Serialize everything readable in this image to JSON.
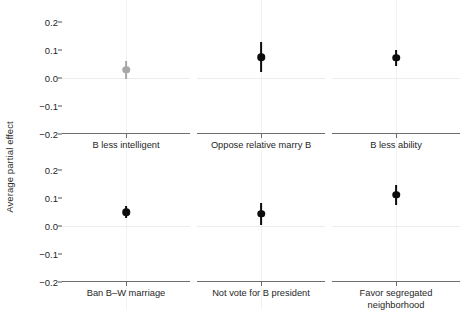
{
  "chart_data": {
    "type": "scatter",
    "title": "",
    "subtitle": "",
    "xlabel": "",
    "ylabel": "Average partial effect",
    "ylim": [
      -0.225,
      0.225
    ],
    "yticks": [
      0.2,
      0.1,
      0.0,
      -0.1,
      -0.2
    ],
    "ytick_labels": [
      "0.2",
      "0.1",
      "0.0",
      "−0.1",
      "−0.2"
    ],
    "grid": "zero-reference line at 0.0 plus faint vertical center gridline per panel",
    "legend": "none",
    "layout": "2 rows × 3 columns of small-multiple panels",
    "marker": "point estimate dot with vertical confidence-interval bar",
    "colors": {
      "significant": "#0d0d0d",
      "nonsignificant": "#a8a8a8",
      "axis": "#6e6e6e",
      "zero_line": "#ececed",
      "grid": "#f2f2f3",
      "text": "#1f1f1f",
      "background": "#ffffff"
    },
    "panels": [
      {
        "label": "B less intelligent",
        "row": 0,
        "col": 0,
        "estimate": 0.029,
        "ci_low": -0.003,
        "ci_high": 0.061,
        "significant": false,
        "color": "#a8a8a8"
      },
      {
        "label": "Oppose relative marry B",
        "row": 0,
        "col": 1,
        "estimate": 0.075,
        "ci_low": 0.021,
        "ci_high": 0.128,
        "significant": true,
        "color": "#0d0d0d"
      },
      {
        "label": "B less ability",
        "row": 0,
        "col": 2,
        "estimate": 0.072,
        "ci_low": 0.043,
        "ci_high": 0.1,
        "significant": true,
        "color": "#0d0d0d"
      },
      {
        "label": "Ban B–W marriage",
        "row": 1,
        "col": 0,
        "estimate": 0.05,
        "ci_low": 0.029,
        "ci_high": 0.071,
        "significant": true,
        "color": "#0d0d0d"
      },
      {
        "label": "Not vote for B president",
        "row": 1,
        "col": 1,
        "estimate": 0.043,
        "ci_low": 0.004,
        "ci_high": 0.082,
        "significant": true,
        "color": "#0d0d0d"
      },
      {
        "label": "Favor segregated\nneighborhood",
        "row": 1,
        "col": 2,
        "estimate": 0.111,
        "ci_low": 0.075,
        "ci_high": 0.146,
        "significant": true,
        "color": "#0d0d0d"
      }
    ]
  }
}
